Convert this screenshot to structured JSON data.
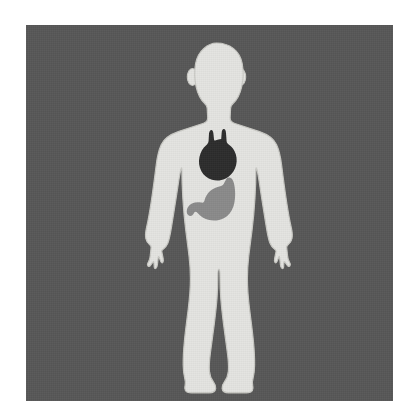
{
  "canvas": {
    "width": 419,
    "height": 418,
    "page_background": "#ffffff"
  },
  "illustration": {
    "title": "Human body diagram with heart and stomach",
    "panel": {
      "label": "illustration-panel",
      "background_color": "#575757",
      "x": 26,
      "y": 25,
      "width": 367,
      "height": 376
    },
    "figure": {
      "label": "Human body silhouette, front view, child or adolescent proportions",
      "fill_color": "#e3e3e0",
      "outline_color": "#c9c9c4",
      "pose": "standing, arms at sides, feet slightly apart"
    },
    "organs": [
      {
        "name": "heart",
        "label": "Heart",
        "color": "#2c2c2c",
        "position": "upper-left chest (viewer's center-right of sternum)",
        "shape": "heart with two great-vessel stubs at top"
      },
      {
        "name": "stomach",
        "label": "Stomach",
        "color": "#8a8a8a",
        "position": "upper abdomen, below and left of heart",
        "shape": "J-shaped with fundus, body and pyloric curve"
      }
    ],
    "body_parts": [
      "head",
      "ears",
      "neck",
      "shoulders",
      "torso",
      "left-arm",
      "right-arm",
      "left-hand",
      "right-hand",
      "hips",
      "left-leg",
      "right-leg",
      "left-foot",
      "right-foot"
    ]
  }
}
